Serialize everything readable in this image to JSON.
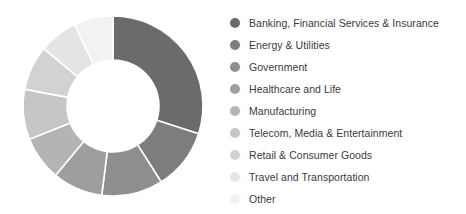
{
  "chart_data": {
    "type": "pie",
    "variant": "donut",
    "title": "",
    "subtitle": "",
    "xlabel": "",
    "ylabel": "",
    "grid": false,
    "legend_position": "right",
    "start_angle_deg": 0,
    "direction": "clockwise",
    "inner_radius_ratio": 0.51,
    "categories": [
      "Banking, Financial Services & Insurance",
      "Energy & Utilities",
      "Government",
      "Healthcare and Life",
      "Manufacturing",
      "Telecom, Media & Entertainment",
      "Retail & Consumer Goods",
      "Travel and Transportation",
      "Other"
    ],
    "values": [
      30,
      11,
      11,
      9,
      8,
      9,
      8,
      7,
      7
    ],
    "colors": [
      "#6b6b6b",
      "#7d7d7d",
      "#8e8e8e",
      "#9e9e9e",
      "#b4b4b4",
      "#c6c6c6",
      "#d2d2d2",
      "#e4e4e4",
      "#f2f2f2"
    ]
  },
  "legend": {
    "items": [
      {
        "label": "Banking, Financial Services & Insurance",
        "color": "#6b6b6b"
      },
      {
        "label": "Energy & Utilities",
        "color": "#7d7d7d"
      },
      {
        "label": "Government",
        "color": "#8e8e8e"
      },
      {
        "label": "Healthcare and Life",
        "color": "#9e9e9e"
      },
      {
        "label": "Manufacturing",
        "color": "#b4b4b4"
      },
      {
        "label": "Telecom, Media & Entertainment",
        "color": "#c6c6c6"
      },
      {
        "label": "Retail & Consumer Goods",
        "color": "#d2d2d2"
      },
      {
        "label": "Travel and Transportation",
        "color": "#e4e4e4"
      },
      {
        "label": "Other",
        "color": "#f2f2f2"
      }
    ]
  },
  "geometry": {
    "center_x": 113,
    "center_y": 106,
    "outer_radius": 90,
    "inner_radius": 46
  }
}
